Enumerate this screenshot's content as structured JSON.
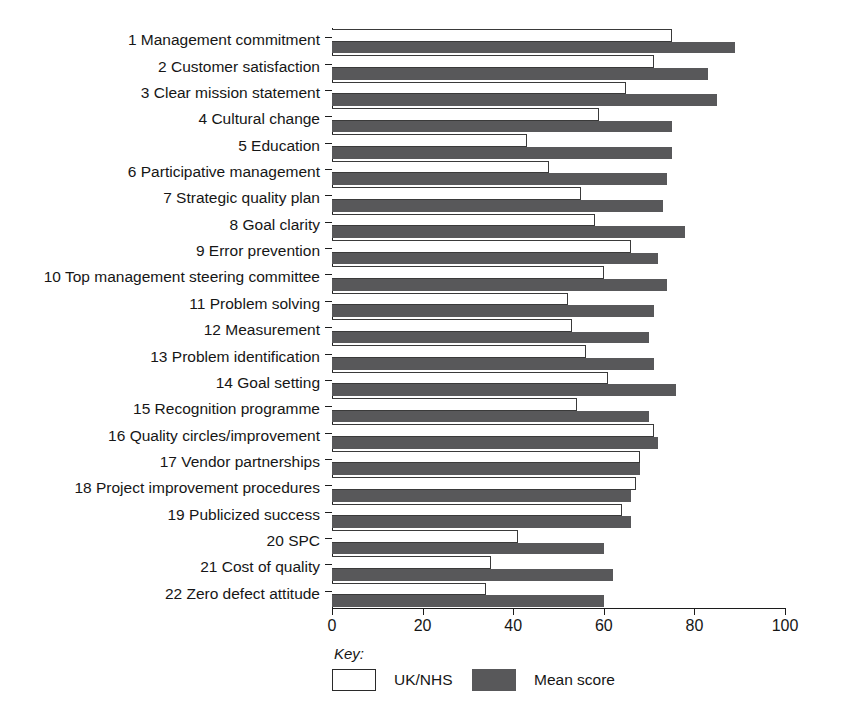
{
  "chart_data": {
    "type": "bar",
    "orientation": "horizontal",
    "title": "",
    "subtitle": "",
    "xlabel": "",
    "ylabel": "",
    "xlim": [
      0,
      100
    ],
    "xticks": [
      0,
      20,
      40,
      60,
      80,
      100
    ],
    "xtick_labels": [
      "0",
      "20",
      "40",
      "60",
      "80",
      "100"
    ],
    "grid": false,
    "legend_position": "bottom-left",
    "legend_title": "Key:",
    "categories": [
      "1 Management commitment",
      "2 Customer satisfaction",
      "3 Clear mission statement",
      "4 Cultural change",
      "5 Education",
      "6 Participative management",
      "7 Strategic quality plan",
      "8 Goal clarity",
      "9 Error prevention",
      "10 Top management steering committee",
      "11 Problem solving",
      "12 Measurement",
      "13 Problem identification",
      "14 Goal setting",
      "15 Recognition programme",
      "16 Quality circles/improvement",
      "17 Vendor partnerships",
      "18 Project improvement procedures",
      "19 Publicized success",
      "20 SPC",
      "21 Cost of quality",
      "22 Zero defect attitude"
    ],
    "series": [
      {
        "name": "UK/NHS",
        "color": "#ffffff",
        "edge_color": "#3a3a3a",
        "values": [
          75,
          71,
          65,
          59,
          43,
          48,
          55,
          58,
          66,
          60,
          52,
          53,
          56,
          61,
          54,
          71,
          68,
          67,
          64,
          41,
          35,
          34
        ]
      },
      {
        "name": "Mean score",
        "color": "#58585a",
        "edge_color": "#58585a",
        "values": [
          89,
          83,
          85,
          75,
          75,
          74,
          73,
          78,
          72,
          74,
          71,
          70,
          71,
          76,
          70,
          72,
          68,
          66,
          66,
          60,
          62,
          60
        ]
      }
    ]
  },
  "legend": {
    "title": "Key:",
    "entries": [
      {
        "label": "UK/NHS",
        "swatch": "white"
      },
      {
        "label": "Mean score",
        "swatch": "dark"
      }
    ]
  },
  "colors": {
    "mean_score_fill": "#58585a",
    "uk_nhs_fill": "#ffffff",
    "axis": "#1c1c1c",
    "text": "#161616",
    "background": "#ffffff"
  }
}
